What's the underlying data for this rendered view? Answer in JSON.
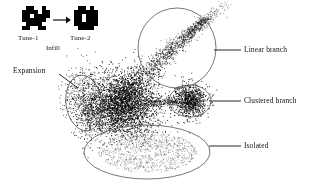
{
  "figure": {
    "width": 321,
    "height": 192,
    "background": "#ffffff",
    "ink": "#111111",
    "outline_color": "#555555"
  },
  "legend_inset": {
    "sprite_1": {
      "name": "tune-1-sprite",
      "label": "Tune-1",
      "fill": "#000000",
      "pixels": [
        [
          1,
          0
        ],
        [
          2,
          0
        ],
        [
          5,
          0
        ],
        [
          0,
          1
        ],
        [
          1,
          1
        ],
        [
          2,
          1
        ],
        [
          3,
          1
        ],
        [
          5,
          1
        ],
        [
          6,
          1
        ],
        [
          0,
          2
        ],
        [
          1,
          2
        ],
        [
          3,
          2
        ],
        [
          4,
          2
        ],
        [
          5,
          2
        ],
        [
          6,
          2
        ],
        [
          0,
          3
        ],
        [
          1,
          3
        ],
        [
          2,
          3
        ],
        [
          3,
          3
        ],
        [
          4,
          3
        ],
        [
          5,
          3
        ],
        [
          1,
          4
        ],
        [
          2,
          4
        ],
        [
          3,
          4
        ],
        [
          4,
          4
        ],
        [
          0,
          5
        ],
        [
          1,
          5
        ],
        [
          4,
          5
        ],
        [
          5,
          5
        ]
      ]
    },
    "sprite_2": {
      "name": "tune-2-sprite",
      "label": "Tune-2",
      "fill": "#000000",
      "pixels": [
        [
          1,
          0
        ],
        [
          2,
          0
        ],
        [
          4,
          0
        ],
        [
          0,
          1
        ],
        [
          1,
          1
        ],
        [
          2,
          1
        ],
        [
          3,
          1
        ],
        [
          4,
          1
        ],
        [
          5,
          1
        ],
        [
          0,
          2
        ],
        [
          1,
          2
        ],
        [
          3,
          2
        ],
        [
          4,
          2
        ],
        [
          5,
          2
        ],
        [
          0,
          3
        ],
        [
          1,
          3
        ],
        [
          3,
          3
        ],
        [
          4,
          3
        ],
        [
          5,
          3
        ],
        [
          0,
          4
        ],
        [
          1,
          4
        ],
        [
          2,
          4
        ],
        [
          3,
          4
        ],
        [
          4,
          4
        ],
        [
          5,
          4
        ],
        [
          1,
          5
        ],
        [
          2,
          5
        ],
        [
          3,
          5
        ],
        [
          4,
          5
        ]
      ]
    },
    "arrow": {
      "name": "arrow-right-icon",
      "glyph": "→"
    },
    "caption": "Infill"
  },
  "annotations": [
    {
      "id": "expansion",
      "label": "Expansion",
      "leader": {
        "x1": 59,
        "y1": 74,
        "x2": 78,
        "y2": 88
      },
      "region": {
        "shape": "ellipse",
        "cx": 84,
        "cy": 103,
        "rx": 18,
        "ry": 28,
        "rotate": -8
      }
    },
    {
      "id": "linear-branch",
      "label": "Linear branch",
      "leader": {
        "x1": 214,
        "y1": 50,
        "x2": 241,
        "y2": 50
      },
      "region": {
        "shape": "ellipse",
        "cx": 177,
        "cy": 48,
        "rx": 39,
        "ry": 40,
        "rotate": 0
      }
    },
    {
      "id": "clustered-branch",
      "label": "Clustered branch",
      "leader": {
        "x1": 209,
        "y1": 101,
        "x2": 241,
        "y2": 101
      },
      "region": {
        "shape": "ellipse",
        "cx": 190,
        "cy": 101,
        "rx": 21,
        "ry": 16,
        "rotate": 0
      }
    },
    {
      "id": "isolated",
      "label": "Isolated",
      "leader": {
        "x1": 209,
        "y1": 146,
        "x2": 241,
        "y2": 146
      },
      "region": {
        "shape": "ellipse",
        "cx": 147,
        "cy": 152,
        "rx": 63,
        "ry": 27,
        "rotate": 0
      }
    }
  ],
  "chart_data": {
    "type": "scatter",
    "title": "",
    "xlabel": "",
    "ylabel": "",
    "xlim": [
      0,
      321
    ],
    "ylim": [
      0,
      192
    ],
    "grid": false,
    "legend_position": "right",
    "point_color": "#000000",
    "point_size": 0.9,
    "clusters": [
      {
        "name": "core-dense-blob",
        "annotation": "",
        "n": 2600,
        "cx": 124,
        "cy": 103,
        "sx": 17,
        "sy": 15,
        "rotate": 0,
        "density": "very-high",
        "opacity": 0.95
      },
      {
        "name": "expansion-cloud",
        "annotation": "Expansion",
        "n": 760,
        "cx": 88,
        "cy": 104,
        "sx": 11,
        "sy": 18,
        "rotate": -8,
        "density": "medium",
        "opacity": 0.75
      },
      {
        "name": "linear-branch-trail",
        "annotation": "Linear branch",
        "n": 1250,
        "x_start": 112,
        "y_start": 104,
        "x_end": 206,
        "y_end": 18,
        "spread_start": 9,
        "spread_end": 2.5,
        "density": "high-to-low",
        "opacity": 0.9
      },
      {
        "name": "linear-branch-sparse-tip",
        "annotation": "Linear branch",
        "n": 110,
        "x_start": 200,
        "y_start": 24,
        "x_end": 226,
        "y_end": 4,
        "spread_start": 3,
        "spread_end": 4,
        "density": "low",
        "opacity": 0.6
      },
      {
        "name": "connector-bridge",
        "annotation": "",
        "n": 260,
        "x_start": 140,
        "y_start": 104,
        "x_end": 177,
        "y_end": 101,
        "spread_start": 3.5,
        "spread_end": 2,
        "density": "medium",
        "opacity": 0.9
      },
      {
        "name": "clustered-branch-blob",
        "annotation": "Clustered branch",
        "n": 900,
        "cx": 190,
        "cy": 100,
        "sx": 8,
        "sy": 8,
        "rotate": 0,
        "density": "very-high",
        "opacity": 0.95
      },
      {
        "name": "isolated-scatter",
        "annotation": "Isolated",
        "n": 950,
        "cx": 147,
        "cy": 152,
        "sx": 34,
        "sy": 14,
        "rotate": 0,
        "density": "sparse",
        "opacity": 0.5
      },
      {
        "name": "isolated-drip",
        "annotation": "Isolated",
        "n": 230,
        "x_start": 128,
        "y_start": 118,
        "x_end": 142,
        "y_end": 142,
        "spread_start": 7,
        "spread_end": 12,
        "density": "low",
        "opacity": 0.55
      },
      {
        "name": "lower-left-halo",
        "annotation": "",
        "n": 300,
        "cx": 104,
        "cy": 120,
        "sx": 14,
        "sy": 9,
        "rotate": 10,
        "density": "low",
        "opacity": 0.55
      }
    ]
  }
}
